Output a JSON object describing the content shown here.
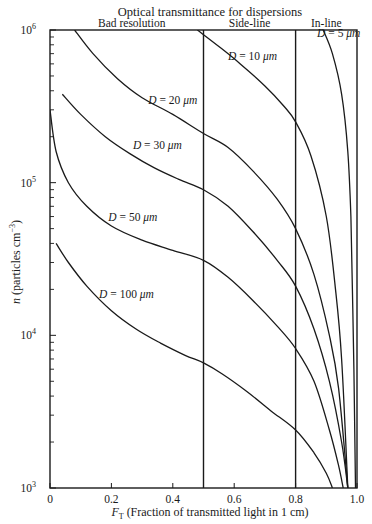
{
  "chart_data": {
    "type": "line",
    "title": "Optical transmittance for dispersions",
    "xlabel": "F_T (Fraction of transmitted light in 1 cm)",
    "xlabel_main": "F",
    "xlabel_sub": "T",
    "xlabel_rest": " (Fraction of transmitted light in 1 cm)",
    "ylabel": "n (particles cm^-3)",
    "xlim": [
      0,
      1.0
    ],
    "ylim": [
      1000,
      1000000
    ],
    "yscale": "log",
    "grid": false,
    "x_ticks": [
      0,
      0.2,
      0.4,
      0.6,
      0.8,
      1.0
    ],
    "x_tick_labels": [
      "0",
      "0.2",
      "0.4",
      "0.6",
      "0.8",
      "1.0"
    ],
    "y_ticks": [
      1000,
      10000,
      100000,
      1000000
    ],
    "y_tick_labels": [
      "10",
      "10",
      "10",
      "10"
    ],
    "y_tick_exponents": [
      "3",
      "4",
      "5",
      "6"
    ],
    "regions": [
      {
        "label": "Bad resolution",
        "from": 0,
        "to": 0.5
      },
      {
        "label": "Side-line",
        "from": 0.5,
        "to": 0.8
      },
      {
        "label": "In-line",
        "from": 0.8,
        "to": 1.0
      }
    ],
    "vertical_lines": [
      0.5,
      0.8
    ],
    "series": [
      {
        "name": "D = 5 μm",
        "label_pos": [
          0.87,
          900000
        ],
        "points": [
          [
            0.89,
            1000000
          ],
          [
            0.92,
            700000
          ],
          [
            0.95,
            380000
          ],
          [
            0.97,
            160000
          ],
          [
            0.98,
            60000
          ],
          [
            0.985,
            20000
          ],
          [
            0.99,
            6000
          ],
          [
            0.995,
            1000
          ]
        ]
      },
      {
        "name": "D = 10 μm",
        "label_pos": [
          0.58,
          640000
        ],
        "points": [
          [
            0.48,
            1000000
          ],
          [
            0.55,
            780000
          ],
          [
            0.62,
            600000
          ],
          [
            0.7,
            430000
          ],
          [
            0.76,
            320000
          ],
          [
            0.8,
            250000
          ],
          [
            0.85,
            150000
          ],
          [
            0.9,
            60000
          ],
          [
            0.93,
            20000
          ],
          [
            0.95,
            7000
          ],
          [
            0.97,
            1000
          ]
        ]
      },
      {
        "name": "D = 20 μm",
        "label_pos": [
          0.32,
          330000
        ],
        "points": [
          [
            0.08,
            1000000
          ],
          [
            0.14,
            700000
          ],
          [
            0.22,
            480000
          ],
          [
            0.3,
            360000
          ],
          [
            0.4,
            280000
          ],
          [
            0.5,
            210000
          ],
          [
            0.58,
            170000
          ],
          [
            0.66,
            120000
          ],
          [
            0.74,
            78000
          ],
          [
            0.8,
            50000
          ],
          [
            0.86,
            25000
          ],
          [
            0.91,
            10000
          ],
          [
            0.94,
            4500
          ],
          [
            0.97,
            1000
          ]
        ]
      },
      {
        "name": "D = 30 μm",
        "label_pos": [
          0.27,
          165000
        ],
        "points": [
          [
            0.04,
            380000
          ],
          [
            0.1,
            280000
          ],
          [
            0.18,
            200000
          ],
          [
            0.26,
            155000
          ],
          [
            0.34,
            125000
          ],
          [
            0.42,
            105000
          ],
          [
            0.5,
            90000
          ],
          [
            0.58,
            70000
          ],
          [
            0.66,
            48000
          ],
          [
            0.74,
            31000
          ],
          [
            0.8,
            21000
          ],
          [
            0.86,
            11000
          ],
          [
            0.91,
            5000
          ],
          [
            0.95,
            2000
          ],
          [
            0.97,
            1000
          ]
        ]
      },
      {
        "name": "D = 50 μm",
        "label_pos": [
          0.19,
          56000
        ],
        "points": [
          [
            0.0,
            300000
          ],
          [
            0.02,
            160000
          ],
          [
            0.06,
            100000
          ],
          [
            0.12,
            70000
          ],
          [
            0.2,
            52000
          ],
          [
            0.3,
            42000
          ],
          [
            0.4,
            36000
          ],
          [
            0.5,
            31000
          ],
          [
            0.58,
            24000
          ],
          [
            0.66,
            17000
          ],
          [
            0.74,
            11500
          ],
          [
            0.8,
            8200
          ],
          [
            0.86,
            5000
          ],
          [
            0.91,
            2400
          ],
          [
            0.94,
            1400
          ],
          [
            0.955,
            1000
          ]
        ]
      },
      {
        "name": "D = 100 μm",
        "label_pos": [
          0.16,
          17500
        ],
        "points": [
          [
            0.02,
            40000
          ],
          [
            0.06,
            30000
          ],
          [
            0.12,
            21000
          ],
          [
            0.2,
            14500
          ],
          [
            0.28,
            11000
          ],
          [
            0.36,
            8900
          ],
          [
            0.44,
            7400
          ],
          [
            0.5,
            6600
          ],
          [
            0.56,
            5600
          ],
          [
            0.64,
            4300
          ],
          [
            0.72,
            3200
          ],
          [
            0.8,
            2400
          ],
          [
            0.86,
            1700
          ],
          [
            0.9,
            1250
          ],
          [
            0.92,
            1000
          ]
        ]
      }
    ]
  }
}
